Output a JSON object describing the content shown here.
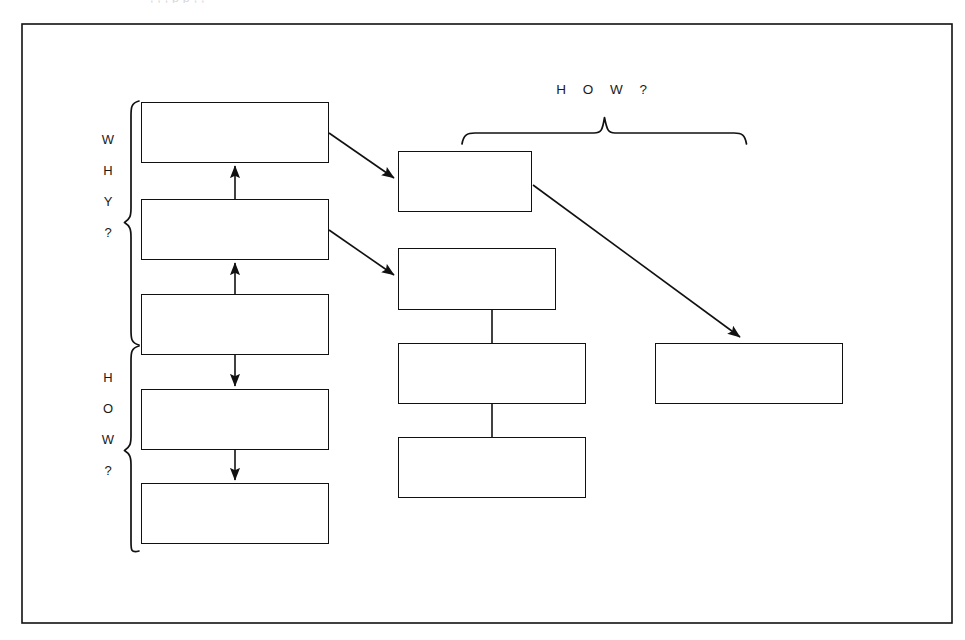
{
  "page": {
    "width": 965,
    "height": 640,
    "background": "#ffffff",
    "ink": "#111111",
    "top_cut_text": ", , , p p , ,"
  },
  "frame": {
    "name": "outer-border",
    "x": 22,
    "y": 24,
    "width": 930,
    "height": 599,
    "stroke": "#111111",
    "stroke_width": 1.6
  },
  "labels": {
    "left_why": {
      "text": "WHY?",
      "letters": [
        "W",
        "H",
        "Y",
        "?"
      ],
      "orientation": "vertical-stacked"
    },
    "left_how": {
      "text": "HOW?",
      "letters": [
        "H",
        "O",
        "W",
        "?"
      ],
      "orientation": "vertical-stacked"
    },
    "top_how": {
      "text": "H O W ?",
      "orientation": "horizontal-spaced"
    }
  },
  "braces": [
    {
      "name": "why-brace",
      "orientation": "vertical",
      "x": 130,
      "y_top": 100,
      "y_bottom": 345,
      "spans": [
        "left-box-1",
        "left-box-2",
        "left-box-3"
      ]
    },
    {
      "name": "how-brace",
      "orientation": "vertical",
      "x": 130,
      "y_top": 345,
      "y_bottom": 551,
      "spans": [
        "left-box-3",
        "left-box-4",
        "left-box-5"
      ]
    },
    {
      "name": "how-top-brace",
      "orientation": "horizontal",
      "y": 131,
      "x_left": 462,
      "x_right": 746,
      "apex_x": 604,
      "spans": [
        "middle-box-1",
        "right-box-1"
      ]
    }
  ],
  "boxes": [
    {
      "id": "left-box-1",
      "column": "left",
      "index": 1,
      "x": 141,
      "y": 102,
      "width": 188,
      "height": 61,
      "text": ""
    },
    {
      "id": "left-box-2",
      "column": "left",
      "index": 2,
      "x": 141,
      "y": 199,
      "width": 188,
      "height": 61,
      "text": ""
    },
    {
      "id": "left-box-3",
      "column": "left",
      "index": 3,
      "x": 141,
      "y": 294,
      "width": 188,
      "height": 61,
      "text": ""
    },
    {
      "id": "left-box-4",
      "column": "left",
      "index": 4,
      "x": 141,
      "y": 389,
      "width": 188,
      "height": 61,
      "text": ""
    },
    {
      "id": "left-box-5",
      "column": "left",
      "index": 5,
      "x": 141,
      "y": 483,
      "width": 188,
      "height": 61,
      "text": ""
    },
    {
      "id": "middle-box-1",
      "column": "middle",
      "index": 1,
      "x": 398,
      "y": 151,
      "width": 134,
      "height": 61,
      "text": ""
    },
    {
      "id": "middle-box-2",
      "column": "middle",
      "index": 2,
      "x": 398,
      "y": 248,
      "width": 158,
      "height": 62,
      "text": ""
    },
    {
      "id": "middle-box-3",
      "column": "middle",
      "index": 3,
      "x": 398,
      "y": 343,
      "width": 188,
      "height": 61,
      "text": ""
    },
    {
      "id": "middle-box-4",
      "column": "middle",
      "index": 4,
      "x": 398,
      "y": 437,
      "width": 188,
      "height": 61,
      "text": ""
    },
    {
      "id": "right-box-1",
      "column": "right",
      "index": 1,
      "x": 655,
      "y": 343,
      "width": 188,
      "height": 61,
      "text": ""
    }
  ],
  "connectors": [
    {
      "name": "left-2-to-1",
      "type": "arrow-up",
      "from": "left-box-2",
      "to": "left-box-1",
      "x1": 235,
      "y1": 199,
      "x2": 235,
      "y2": 163
    },
    {
      "name": "left-3-to-2",
      "type": "arrow-up",
      "from": "left-box-3",
      "to": "left-box-2",
      "x1": 235,
      "y1": 294,
      "x2": 235,
      "y2": 260
    },
    {
      "name": "left-3-to-4",
      "type": "arrow-down",
      "from": "left-box-3",
      "to": "left-box-4",
      "x1": 235,
      "y1": 355,
      "x2": 235,
      "y2": 389
    },
    {
      "name": "left-4-to-5",
      "type": "arrow-down",
      "from": "left-box-4",
      "to": "left-box-5",
      "x1": 235,
      "y1": 450,
      "x2": 235,
      "y2": 483
    },
    {
      "name": "left-1-to-middle-1",
      "type": "arrow-diagonal",
      "from": "left-box-1",
      "to": "middle-box-1",
      "x1": 329,
      "y1": 133,
      "x2": 397,
      "y2": 180
    },
    {
      "name": "left-2-to-middle-2",
      "type": "arrow-diagonal",
      "from": "left-box-2",
      "to": "middle-box-2",
      "x1": 329,
      "y1": 230,
      "x2": 397,
      "y2": 277
    },
    {
      "name": "middle-1-to-right-1",
      "type": "arrow-diagonal",
      "from": "middle-box-1",
      "to": "right-box-1",
      "x1": 533,
      "y1": 185,
      "x2": 742,
      "y2": 339
    },
    {
      "name": "middle-2-to-3",
      "type": "line",
      "from": "middle-box-2",
      "to": "middle-box-3",
      "x1": 492,
      "y1": 310,
      "x2": 492,
      "y2": 343
    },
    {
      "name": "middle-3-to-4",
      "type": "line",
      "from": "middle-box-3",
      "to": "middle-box-4",
      "x1": 492,
      "y1": 404,
      "x2": 492,
      "y2": 437
    }
  ]
}
